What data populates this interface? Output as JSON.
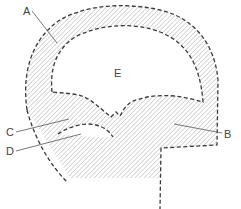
{
  "figure": {
    "type": "cross-section diagram",
    "hatch_color": "#b0b0b0",
    "line_color": "#3a3a3a",
    "labels": [
      {
        "id": "A",
        "text": "A",
        "target": "outer wall band (hatched arc)"
      },
      {
        "id": "B",
        "text": "B",
        "target": "lower right hatched mass"
      },
      {
        "id": "C",
        "text": "C",
        "target": "upper shelf region"
      },
      {
        "id": "D",
        "text": "D",
        "target": "lens-shaped cavity"
      },
      {
        "id": "E",
        "text": "E",
        "target": "inner open chamber"
      }
    ]
  }
}
